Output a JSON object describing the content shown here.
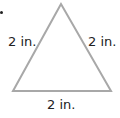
{
  "diagram": {
    "shape": "equilateral triangle",
    "stroke_color": "#a8a8a8",
    "sides": [
      {
        "position": "left",
        "label": "2 in."
      },
      {
        "position": "right",
        "label": "2 in."
      },
      {
        "position": "bottom",
        "label": "2 in."
      }
    ]
  }
}
